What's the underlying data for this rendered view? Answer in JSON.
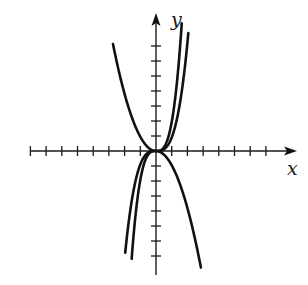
{
  "chart_data": {
    "type": "line",
    "title": "",
    "xlabel": "x",
    "ylabel": "y",
    "grid": false,
    "legend": null,
    "tick_labels": "none (unlabeled unit ticks)",
    "x_ticks": [
      -8,
      -7,
      -6,
      -5,
      -4,
      -3,
      -2,
      -1,
      1,
      2,
      3,
      4,
      5,
      6,
      7
    ],
    "y_ticks": [
      -7,
      -6,
      -5,
      -4,
      -3,
      -2,
      -1,
      1,
      2,
      3,
      4,
      5,
      6,
      7
    ],
    "xlim": [
      -8.0,
      8.9
    ],
    "ylim": [
      -8.3,
      9.2
    ],
    "series": [
      {
        "name": "decreasing odd curve (top-left to bottom-right)",
        "form": "y = -0.95 * x * |x|",
        "coef": -0.95,
        "power": 2,
        "x_range": [
          -2.74,
          2.86
        ],
        "sample_points": [
          [
            -2.74,
            7.2
          ],
          [
            -2.3,
            5.2
          ],
          [
            -1.61,
            2.9
          ],
          [
            -0.83,
            0.93
          ],
          [
            0,
            0
          ],
          [
            0.83,
            -0.65
          ],
          [
            1.6,
            -2.4
          ],
          [
            2.3,
            -5.0
          ],
          [
            2.86,
            -7.1
          ]
        ]
      },
      {
        "name": "increasing odd curve, outer (bottom-left to top-right)",
        "form": "y = 0.9 * x^3",
        "coef": 0.9,
        "power": 3,
        "x_range": [
          -1.96,
          2.06
        ],
        "sample_points": [
          [
            -1.96,
            -7.1
          ],
          [
            -1.5,
            -3.0
          ],
          [
            -1.0,
            -0.9
          ],
          [
            0,
            0
          ],
          [
            1.0,
            0.9
          ],
          [
            1.5,
            3.0
          ],
          [
            2.06,
            7.2
          ]
        ]
      },
      {
        "name": "increasing odd curve, inner (bottom-left to top-right)",
        "form": "y = 1.93 * x^3",
        "coef": 1.93,
        "power": 3,
        "x_range": [
          -1.55,
          1.64
        ],
        "sample_points": [
          [
            -1.55,
            -7.1
          ],
          [
            -1.0,
            -1.9
          ],
          [
            0,
            0
          ],
          [
            1.0,
            1.9
          ],
          [
            1.64,
            7.2
          ]
        ]
      }
    ]
  },
  "axes": {
    "x_label": "x",
    "y_label": "y"
  },
  "layout_px": {
    "origin": [
      156,
      151
    ],
    "unit_x": 15.7,
    "unit_y": 15.0,
    "x_axis_from": 30,
    "x_axis_to": 297,
    "y_axis_from": 275,
    "y_axis_to": 13
  }
}
